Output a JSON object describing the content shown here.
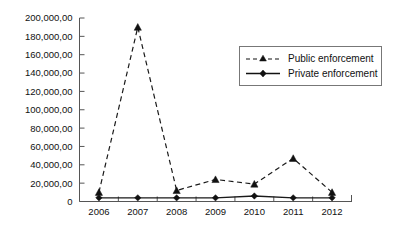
{
  "chart_data": {
    "type": "line",
    "title": "",
    "xlabel": "",
    "ylabel": "",
    "categories": [
      "2006",
      "2007",
      "2008",
      "2009",
      "2010",
      "2011",
      "2012"
    ],
    "ylim": [
      0,
      20000000
    ],
    "y_ticks": [
      0,
      2000000,
      4000000,
      6000000,
      8000000,
      10000000,
      12000000,
      14000000,
      16000000,
      18000000,
      20000000
    ],
    "y_tick_labels": [
      "0",
      "20,000,00",
      "40,000,00",
      "60,000,00",
      "80,000,00",
      "100,000,00",
      "120,000,00",
      "140,000,00",
      "160,000,00",
      "180,000,00",
      "200,000,00"
    ],
    "grid": false,
    "legend_position": "upper right",
    "series": [
      {
        "name": "Public enforcement",
        "marker": "triangle",
        "linestyle": "dashed",
        "color": "#111111",
        "values": [
          1000000,
          19000000,
          1200000,
          2400000,
          1900000,
          4700000,
          1000000
        ]
      },
      {
        "name": "Private enforcement",
        "marker": "diamond",
        "linestyle": "solid",
        "color": "#111111",
        "values": [
          400000,
          400000,
          400000,
          400000,
          600000,
          400000,
          400000
        ]
      }
    ]
  },
  "legend": {
    "items": [
      {
        "label": "Public enforcement"
      },
      {
        "label": "Private enforcement"
      }
    ]
  },
  "axes": {
    "y_axis_name": "value-axis",
    "x_axis_name": "year-axis"
  }
}
